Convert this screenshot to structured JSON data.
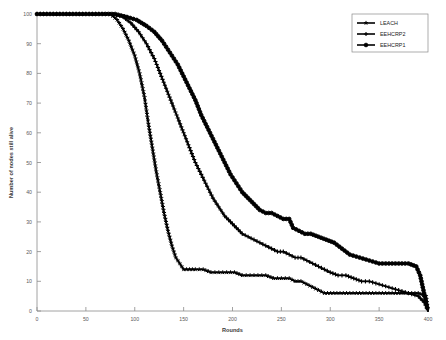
{
  "chart_data": {
    "type": "line",
    "title": "",
    "xlabel": "Rounds",
    "ylabel": "Number of nodes still alive",
    "xlim": [
      0,
      400
    ],
    "ylim": [
      0,
      100
    ],
    "xticks": [
      0,
      50,
      100,
      150,
      200,
      250,
      300,
      350,
      400
    ],
    "yticks": [
      0,
      10,
      20,
      30,
      40,
      50,
      60,
      70,
      80,
      90,
      100
    ],
    "grid": false,
    "legend_position": "top-right",
    "series": [
      {
        "name": "LEACH",
        "marker": "star",
        "color": "#000000",
        "x": [
          0,
          60,
          75,
          82,
          88,
          94,
          100,
          105,
          110,
          114,
          118,
          122,
          126,
          130,
          134,
          138,
          142,
          146,
          150,
          156,
          162,
          170,
          178,
          186,
          194,
          202,
          210,
          218,
          226,
          234,
          242,
          250,
          258,
          264,
          270,
          276,
          282,
          288,
          294,
          310,
          330,
          350,
          370,
          390,
          398,
          400
        ],
        "y": [
          100,
          100,
          100,
          98,
          95,
          91,
          86,
          80,
          72,
          63,
          55,
          47,
          40,
          33,
          27,
          22,
          18,
          16,
          14,
          14,
          14,
          14,
          13,
          13,
          13,
          13,
          12,
          12,
          12,
          12,
          11,
          11,
          11,
          10,
          10,
          9,
          8,
          7,
          6,
          6,
          6,
          6,
          6,
          6,
          5,
          0
        ]
      },
      {
        "name": "EEHCRP2",
        "marker": "plus",
        "color": "#000000",
        "x": [
          0,
          60,
          78,
          88,
          96,
          104,
          112,
          120,
          126,
          132,
          138,
          144,
          150,
          156,
          162,
          168,
          174,
          180,
          186,
          192,
          198,
          204,
          210,
          216,
          222,
          228,
          234,
          240,
          246,
          252,
          258,
          264,
          270,
          276,
          282,
          288,
          294,
          300,
          308,
          316,
          324,
          332,
          340,
          350,
          360,
          370,
          380,
          390,
          396,
          400
        ],
        "x_note": "monotonic decline, intermediate curve",
        "y": [
          100,
          100,
          100,
          99,
          97,
          94,
          90,
          85,
          80,
          75,
          70,
          65,
          60,
          55,
          50,
          46,
          42,
          38,
          35,
          32,
          30,
          28,
          26,
          25,
          24,
          23,
          22,
          21,
          20,
          20,
          19,
          18,
          18,
          17,
          16,
          15,
          14,
          13,
          12,
          12,
          11,
          10,
          10,
          9,
          8,
          7,
          6,
          5,
          3,
          0
        ]
      },
      {
        "name": "EEHCRP1",
        "marker": "circle",
        "color": "#000000",
        "x": [
          0,
          60,
          80,
          92,
          102,
          112,
          120,
          128,
          136,
          144,
          150,
          156,
          162,
          168,
          174,
          180,
          186,
          192,
          198,
          204,
          210,
          216,
          222,
          228,
          234,
          240,
          246,
          252,
          258,
          262,
          268,
          274,
          280,
          288,
          296,
          304,
          312,
          320,
          330,
          340,
          350,
          360,
          370,
          380,
          388,
          392,
          396,
          400
        ],
        "y": [
          100,
          100,
          100,
          99,
          98,
          96,
          94,
          91,
          87,
          83,
          79,
          75,
          71,
          66,
          62,
          58,
          54,
          50,
          46,
          43,
          40,
          38,
          36,
          34,
          33,
          33,
          32,
          31,
          31,
          28,
          27,
          26,
          26,
          25,
          24,
          23,
          21,
          19,
          18,
          17,
          16,
          16,
          16,
          16,
          15,
          12,
          6,
          0
        ]
      }
    ]
  },
  "legend": {
    "items": [
      {
        "label": "LEACH",
        "marker": "star"
      },
      {
        "label": "EEHCRP2",
        "marker": "plus"
      },
      {
        "label": "EEHCRP1",
        "marker": "circle"
      }
    ]
  }
}
